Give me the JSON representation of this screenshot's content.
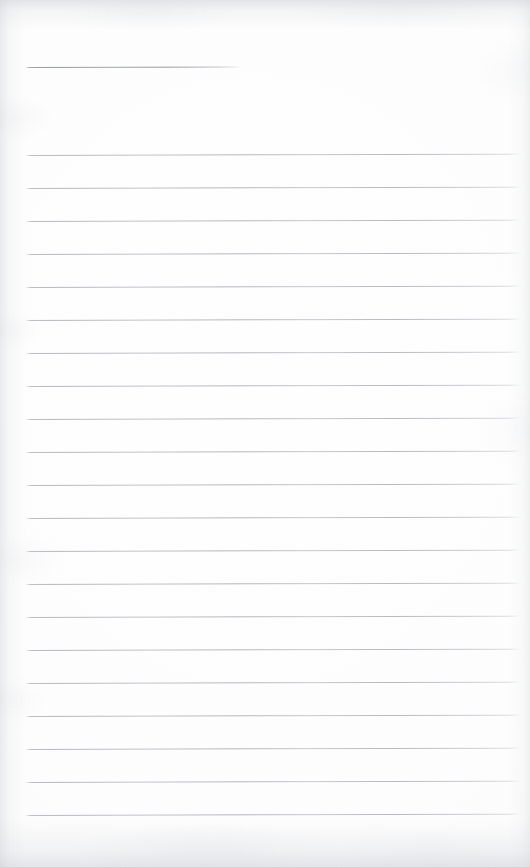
{
  "document": {
    "kind": "scanned-document",
    "subject": "blank ruled notebook page",
    "page_width": 530,
    "page_height": 867,
    "text_content": "",
    "handwriting_present": false,
    "printed_text_present": false,
    "colors": {
      "paper": "#fdfdfd",
      "rule": "#b9bdc3",
      "title_rule": "#9a9ea6",
      "edge_shadow": "#cdd0d6"
    }
  },
  "ruling": {
    "left_x": 25,
    "right_x": 521,
    "line_thickness": 1,
    "line_spacing": 33.0,
    "skew_degrees": -0.16,
    "title_rule": {
      "y": 67,
      "left_x": 25,
      "right_x": 241,
      "label": "title-rule"
    },
    "body_rules": [
      {
        "y": 155
      },
      {
        "y": 188
      },
      {
        "y": 221
      },
      {
        "y": 254
      },
      {
        "y": 287
      },
      {
        "y": 320
      },
      {
        "y": 353
      },
      {
        "y": 386
      },
      {
        "y": 419
      },
      {
        "y": 452
      },
      {
        "y": 485
      },
      {
        "y": 518
      },
      {
        "y": 551
      },
      {
        "y": 584
      },
      {
        "y": 617
      },
      {
        "y": 650
      },
      {
        "y": 683
      },
      {
        "y": 716
      },
      {
        "y": 749
      },
      {
        "y": 782
      },
      {
        "y": 815
      }
    ]
  }
}
